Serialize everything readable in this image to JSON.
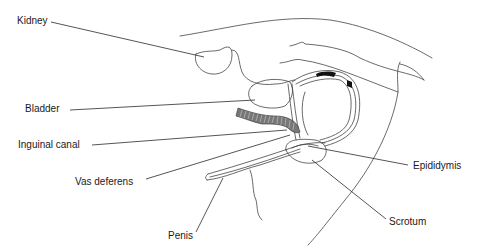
{
  "diagram": {
    "type": "anatomical-line-drawing",
    "labels": {
      "kidney": "Kidney",
      "bladder": "Bladder",
      "inguinal_canal": "Inguinal canal",
      "vas_deferens": "Vas deferens",
      "penis": "Penis",
      "epididymis": "Epididymis",
      "scrotum": "Scrotum"
    },
    "colors": {
      "line": "#333333",
      "leader": "#2a2a2a",
      "text": "#1a1a1a",
      "background": "#ffffff"
    }
  }
}
